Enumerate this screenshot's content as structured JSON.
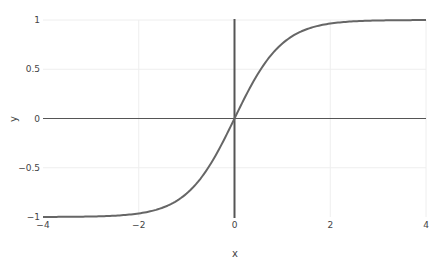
{
  "chart_data": {
    "type": "line",
    "title": "",
    "xlabel": "x",
    "ylabel": "y",
    "xlim": [
      -4,
      4
    ],
    "ylim": [
      -1,
      1
    ],
    "grid": true,
    "legend": "none",
    "x_ticks": [
      -4,
      -2,
      0,
      2,
      4
    ],
    "x_tick_labels": [
      "−4",
      "−2",
      "0",
      "2",
      "4"
    ],
    "y_ticks": [
      -1,
      -0.5,
      0,
      0.5,
      1
    ],
    "y_tick_labels": [
      "−1",
      "−0.5",
      "0",
      "0.5",
      "1"
    ],
    "series": [
      {
        "name": "tanh(x)",
        "color": "#666666",
        "x": [
          -4,
          -3.5,
          -3,
          -2.5,
          -2,
          -1.75,
          -1.5,
          -1.25,
          -1,
          -0.75,
          -0.5,
          -0.25,
          0,
          0.25,
          0.5,
          0.75,
          1,
          1.25,
          1.5,
          1.75,
          2,
          2.5,
          3,
          3.5,
          4
        ],
        "y": [
          -0.999,
          -0.998,
          -0.995,
          -0.987,
          -0.964,
          -0.941,
          -0.905,
          -0.848,
          -0.762,
          -0.635,
          -0.462,
          -0.245,
          0,
          0.245,
          0.462,
          0.635,
          0.762,
          0.848,
          0.905,
          0.941,
          0.964,
          0.987,
          0.995,
          0.998,
          0.999
        ]
      }
    ],
    "zero_lines": {
      "x0": true,
      "y0": true,
      "color": "#555555"
    }
  },
  "axes": {
    "x_title": "x",
    "y_title": "y"
  }
}
